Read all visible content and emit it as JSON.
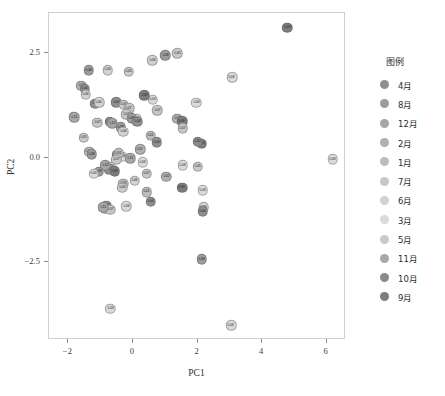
{
  "chart_data": {
    "type": "scatter",
    "title": "",
    "xlabel": "PC1",
    "ylabel": "PC2",
    "xlim": [
      -2.6,
      6.6
    ],
    "ylim": [
      -4.35,
      3.45
    ],
    "xticks": [
      -2,
      0,
      2,
      4,
      6
    ],
    "xticklabels": [
      "−2",
      "0",
      "2",
      "4",
      "6"
    ],
    "yticks": [
      2.5,
      0.0,
      -2.5
    ],
    "yticklabels": [
      "2.5",
      "0.0",
      "−2.5"
    ],
    "grid": false,
    "legend": {
      "title": "图例",
      "position": "right",
      "entries": [
        {
          "label": "4月",
          "color": "#8f8f8f"
        },
        {
          "label": "8月",
          "color": "#9c9c9c"
        },
        {
          "label": "12月",
          "color": "#a6a6a6"
        },
        {
          "label": "2月",
          "color": "#b0b0b0"
        },
        {
          "label": "1月",
          "color": "#bcbcbc"
        },
        {
          "label": "7月",
          "color": "#c7c7c7"
        },
        {
          "label": "6月",
          "color": "#d2d2d2"
        },
        {
          "label": "3月",
          "color": "#dadada"
        },
        {
          "label": "5月",
          "color": "#c9c9c9"
        },
        {
          "label": "11月",
          "color": "#a8a8a8"
        },
        {
          "label": "10月",
          "color": "#8a8a8a"
        },
        {
          "label": "9月",
          "color": "#7d7d7d"
        }
      ]
    },
    "points": [
      {
        "label": "L09",
        "x": 4.78,
        "y": 3.1,
        "color": "#7d7d7d"
      },
      {
        "label": "L05",
        "x": 1.38,
        "y": 2.49,
        "color": "#c9c9c9"
      },
      {
        "label": "L06",
        "x": 0.6,
        "y": 2.32,
        "color": "#d2d2d2"
      },
      {
        "label": "L08",
        "x": 1.0,
        "y": 2.44,
        "color": "#9c9c9c"
      },
      {
        "label": "L03",
        "x": 3.07,
        "y": 1.92,
        "color": "#dadada"
      },
      {
        "label": "L08",
        "x": -1.37,
        "y": 2.08,
        "color": "#9c9c9c"
      },
      {
        "label": "L06",
        "x": -0.78,
        "y": 2.09,
        "color": "#d2d2d2"
      },
      {
        "label": "L05",
        "x": -0.13,
        "y": 2.05,
        "color": "#c9c9c9"
      },
      {
        "label": "L02",
        "x": -1.6,
        "y": 1.71,
        "color": "#b0b0b0"
      },
      {
        "label": "L04",
        "x": -1.5,
        "y": 1.64,
        "color": "#8f8f8f"
      },
      {
        "label": "L06",
        "x": -1.46,
        "y": 1.5,
        "color": "#d2d2d2"
      },
      {
        "label": "L03",
        "x": 0.62,
        "y": 1.38,
        "color": "#dadada"
      },
      {
        "label": "L09",
        "x": 0.35,
        "y": 1.49,
        "color": "#7d7d7d"
      },
      {
        "label": "L07",
        "x": 0.75,
        "y": 1.13,
        "color": "#c7c7c7"
      },
      {
        "label": "L02",
        "x": 1.38,
        "y": 0.93,
        "color": "#b0b0b0"
      },
      {
        "label": "L09",
        "x": 1.52,
        "y": 0.87,
        "color": "#7d7d7d"
      },
      {
        "label": "L06",
        "x": 0.1,
        "y": 0.93,
        "color": "#d2d2d2"
      },
      {
        "label": "L04",
        "x": -1.17,
        "y": 1.29,
        "color": "#8f8f8f"
      },
      {
        "label": "L06",
        "x": -1.05,
        "y": 1.32,
        "color": "#d2d2d2"
      },
      {
        "label": "L04",
        "x": -0.52,
        "y": 1.32,
        "color": "#8f8f8f"
      },
      {
        "label": "L05",
        "x": -0.29,
        "y": 1.26,
        "color": "#c9c9c9"
      },
      {
        "label": "L07",
        "x": -0.12,
        "y": 1.18,
        "color": "#c7c7c7"
      },
      {
        "label": "L02",
        "x": -1.84,
        "y": 0.98,
        "color": "#b0b0b0"
      },
      {
        "label": "L11",
        "x": -1.82,
        "y": 0.96,
        "color": "#a8a8a8"
      },
      {
        "label": "L07",
        "x": -1.1,
        "y": 0.83,
        "color": "#c7c7c7"
      },
      {
        "label": "L10",
        "x": -0.72,
        "y": 0.86,
        "color": "#8a8a8a"
      },
      {
        "label": "L12",
        "x": -0.64,
        "y": 0.82,
        "color": "#a6a6a6"
      },
      {
        "label": "L08",
        "x": -0.37,
        "y": 0.72,
        "color": "#9c9c9c"
      },
      {
        "label": "L07",
        "x": -0.2,
        "y": 1.03,
        "color": "#c7c7c7"
      },
      {
        "label": "L08",
        "x": -0.03,
        "y": 0.94,
        "color": "#9c9c9c"
      },
      {
        "label": "L04",
        "x": 0.13,
        "y": 0.86,
        "color": "#8f8f8f"
      },
      {
        "label": "L06",
        "x": -0.3,
        "y": 0.62,
        "color": "#d2d2d2"
      },
      {
        "label": "L05",
        "x": -1.52,
        "y": 0.48,
        "color": "#c9c9c9"
      },
      {
        "label": "L01",
        "x": 0.55,
        "y": 0.52,
        "color": "#bcbcbc"
      },
      {
        "label": "L04",
        "x": 0.73,
        "y": 0.37,
        "color": "#8f8f8f"
      },
      {
        "label": "L02",
        "x": 0.22,
        "y": 0.2,
        "color": "#b0b0b0"
      },
      {
        "label": "L03",
        "x": -0.32,
        "y": 0.02,
        "color": "#dadada"
      },
      {
        "label": "L10",
        "x": -0.48,
        "y": 0.07,
        "color": "#8a8a8a"
      },
      {
        "label": "L01",
        "x": -0.44,
        "y": 0.1,
        "color": "#bcbcbc"
      },
      {
        "label": "L07",
        "x": -0.52,
        "y": -0.05,
        "color": "#c7c7c7"
      },
      {
        "label": "L01",
        "x": -1.36,
        "y": 0.14,
        "color": "#bcbcbc"
      },
      {
        "label": "L08",
        "x": -1.28,
        "y": 0.08,
        "color": "#9c9c9c"
      },
      {
        "label": "L11",
        "x": -0.08,
        "y": -0.02,
        "color": "#a8a8a8"
      },
      {
        "label": "L03",
        "x": 0.3,
        "y": -0.11,
        "color": "#dadada"
      },
      {
        "label": "L06",
        "x": -0.68,
        "y": -0.22,
        "color": "#d2d2d2"
      },
      {
        "label": "L04",
        "x": -0.73,
        "y": -0.28,
        "color": "#8f8f8f"
      },
      {
        "label": "L09",
        "x": -0.56,
        "y": -0.32,
        "color": "#7d7d7d"
      },
      {
        "label": "L12",
        "x": -0.85,
        "y": -0.18,
        "color": "#a6a6a6"
      },
      {
        "label": "L08",
        "x": -1.06,
        "y": -0.34,
        "color": "#9c9c9c"
      },
      {
        "label": "L03",
        "x": -1.21,
        "y": -0.38,
        "color": "#dadada"
      },
      {
        "label": "L07",
        "x": 0.43,
        "y": -0.38,
        "color": "#c7c7c7"
      },
      {
        "label": "L02",
        "x": 1.03,
        "y": -0.45,
        "color": "#b0b0b0"
      },
      {
        "label": "L06",
        "x": 0.05,
        "y": -0.55,
        "color": "#d2d2d2"
      },
      {
        "label": "L01",
        "x": -0.3,
        "y": -0.62,
        "color": "#bcbcbc"
      },
      {
        "label": "L05",
        "x": -0.33,
        "y": -0.72,
        "color": "#c9c9c9"
      },
      {
        "label": "L03",
        "x": 1.54,
        "y": -0.18,
        "color": "#dadada"
      },
      {
        "label": "L05",
        "x": 2.0,
        "y": -0.22,
        "color": "#c9c9c9"
      },
      {
        "label": "L09",
        "x": 2.13,
        "y": 0.33,
        "color": "#7d7d7d"
      },
      {
        "label": "L10",
        "x": 2.0,
        "y": 0.38,
        "color": "#8a8a8a"
      },
      {
        "label": "L07",
        "x": 1.55,
        "y": 0.7,
        "color": "#c7c7c7"
      },
      {
        "label": "L03",
        "x": 1.96,
        "y": 1.31,
        "color": "#dadada"
      },
      {
        "label": "L04",
        "x": -0.83,
        "y": -1.15,
        "color": "#8f8f8f"
      },
      {
        "label": "L02",
        "x": -0.88,
        "y": -1.22,
        "color": "#b0b0b0"
      },
      {
        "label": "L07",
        "x": -0.7,
        "y": -1.24,
        "color": "#c7c7c7"
      },
      {
        "label": "L11",
        "x": -0.92,
        "y": -1.18,
        "color": "#a8a8a8"
      },
      {
        "label": "L03",
        "x": -0.21,
        "y": -1.16,
        "color": "#dadada"
      },
      {
        "label": "L04",
        "x": 0.55,
        "y": -1.05,
        "color": "#8f8f8f"
      },
      {
        "label": "L01",
        "x": 0.43,
        "y": -0.82,
        "color": "#bcbcbc"
      },
      {
        "label": "L09",
        "x": 1.52,
        "y": -0.72,
        "color": "#7d7d7d"
      },
      {
        "label": "L03",
        "x": 2.16,
        "y": -0.78,
        "color": "#dadada"
      },
      {
        "label": "L06",
        "x": 2.2,
        "y": -1.18,
        "color": "#d2d2d2"
      },
      {
        "label": "L04",
        "x": 2.17,
        "y": -1.28,
        "color": "#8f8f8f"
      },
      {
        "label": "L08",
        "x": 2.13,
        "y": -2.42,
        "color": "#9c9c9c"
      },
      {
        "label": "L03",
        "x": 6.19,
        "y": -0.04,
        "color": "#dadada"
      },
      {
        "label": "L03",
        "x": -0.7,
        "y": -3.6,
        "color": "#dadada"
      },
      {
        "label": "L03",
        "x": 3.04,
        "y": -4.0,
        "color": "#dadada"
      }
    ]
  }
}
